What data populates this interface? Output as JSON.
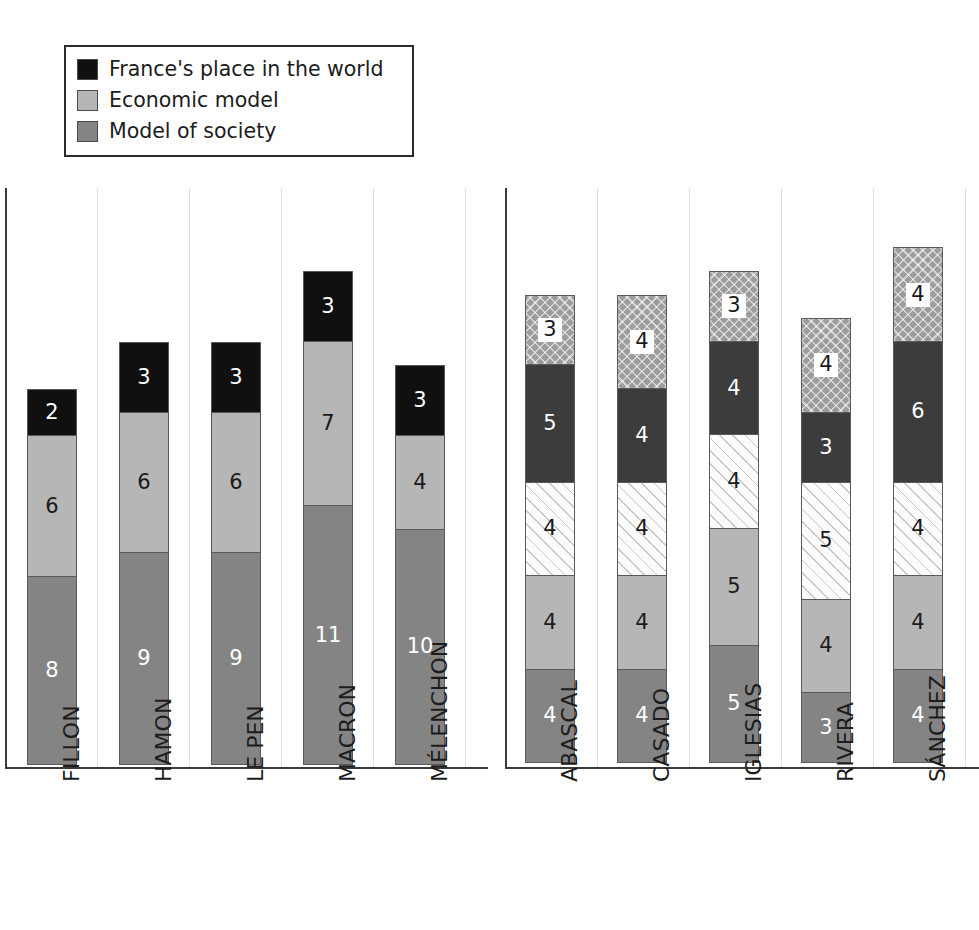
{
  "legends": {
    "left": {
      "name": "france-legend",
      "items": [
        {
          "label": "France's place in the world",
          "fill": "black",
          "color": "#101010"
        },
        {
          "label": "Economic model",
          "fill": "lgray",
          "color": "#b6b6b6"
        },
        {
          "label": "Model of society",
          "fill": "mgray",
          "color": "#848484"
        }
      ]
    },
    "right": {
      "name": "spain-legend",
      "items": [
        {
          "label": "International politics",
          "fill": "cross",
          "color": "#9d9d9d"
        },
        {
          "label": "Democratic quality",
          "fill": "dgray",
          "color": "#3c3c3c"
        },
        {
          "label": "Social policies and equality",
          "fill": "diag",
          "color": "#fcfcfc"
        },
        {
          "label": "Economy",
          "fill": "lgray",
          "color": "#b6b6b6"
        },
        {
          "label": "Spanish cohesion",
          "fill": "mgray",
          "color": "#848484"
        }
      ]
    }
  },
  "chart_data": [
    {
      "type": "bar",
      "id": "france-chart",
      "stacked": true,
      "title": "",
      "xlabel": "",
      "ylabel": "",
      "grid": true,
      "legend_position": "top-left",
      "ylim": [
        0,
        24
      ],
      "categories": [
        "FILLON",
        "HAMON",
        "LE PEN",
        "MACRON",
        "MÉLENCHON"
      ],
      "series": [
        {
          "name": "Model of society",
          "fill": "mgray",
          "values": [
            8,
            9,
            9,
            11,
            10
          ]
        },
        {
          "name": "Economic model",
          "fill": "lgray",
          "values": [
            6,
            6,
            6,
            7,
            4
          ]
        },
        {
          "name": "France's place in the world",
          "fill": "black",
          "values": [
            2,
            3,
            3,
            3,
            3
          ]
        }
      ],
      "totals": [
        16,
        18,
        18,
        21,
        17
      ]
    },
    {
      "type": "bar",
      "id": "spain-chart",
      "stacked": true,
      "title": "",
      "xlabel": "",
      "ylabel": "",
      "grid": true,
      "legend_position": "top",
      "ylim": [
        0,
        24
      ],
      "categories": [
        "ABASCAL",
        "CASADO",
        "IGLESIAS",
        "RIVERA",
        "SÁNCHEZ"
      ],
      "series": [
        {
          "name": "Spanish cohesion",
          "fill": "mgray",
          "values": [
            4,
            4,
            5,
            3,
            4
          ]
        },
        {
          "name": "Economy",
          "fill": "lgray",
          "values": [
            4,
            4,
            5,
            4,
            4
          ]
        },
        {
          "name": "Social policies and equality",
          "fill": "diag",
          "values": [
            4,
            4,
            4,
            5,
            4
          ]
        },
        {
          "name": "Democratic quality",
          "fill": "dgray",
          "values": [
            5,
            4,
            4,
            3,
            6
          ]
        },
        {
          "name": "International politics",
          "fill": "cross",
          "values": [
            3,
            4,
            3,
            4,
            4
          ]
        }
      ],
      "totals": [
        20,
        20,
        21,
        19,
        22
      ]
    }
  ]
}
